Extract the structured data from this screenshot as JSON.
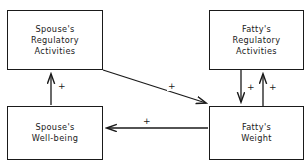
{
  "diagram": {
    "type": "causal-path-diagram",
    "nodes": [
      {
        "id": "spouse-regulatory",
        "lines": [
          "Spouse's",
          "Regulatory",
          "Activities"
        ]
      },
      {
        "id": "fatty-regulatory",
        "lines": [
          "Fatty's",
          "Regulatory",
          "Activities"
        ]
      },
      {
        "id": "spouse-wellbeing",
        "lines": [
          "Spouse's",
          "Well-being"
        ]
      },
      {
        "id": "fatty-weight",
        "lines": [
          "Fatty's",
          "Weight"
        ]
      }
    ],
    "edges": [
      {
        "id": "wellbeing-to-regulatory",
        "from": "spouse-wellbeing",
        "to": "spouse-regulatory",
        "direction": "up",
        "sign": "+"
      },
      {
        "id": "spouse-reg-to-weight",
        "from": "spouse-regulatory",
        "to": "fatty-weight",
        "direction": "diagonal-down-right",
        "sign": "+"
      },
      {
        "id": "fattyreg-to-weight",
        "from": "fatty-regulatory",
        "to": "fatty-weight",
        "direction": "down",
        "sign": "+"
      },
      {
        "id": "weight-to-fattyreg",
        "from": "fatty-weight",
        "to": "fatty-regulatory",
        "direction": "up",
        "sign": "+"
      },
      {
        "id": "weight-to-wellbeing",
        "from": "fatty-weight",
        "to": "spouse-wellbeing",
        "direction": "left",
        "sign": "+"
      }
    ],
    "colors": {
      "stroke": "#1a1a1a",
      "background": "#ffffff",
      "text": "#1a1a1a"
    }
  }
}
